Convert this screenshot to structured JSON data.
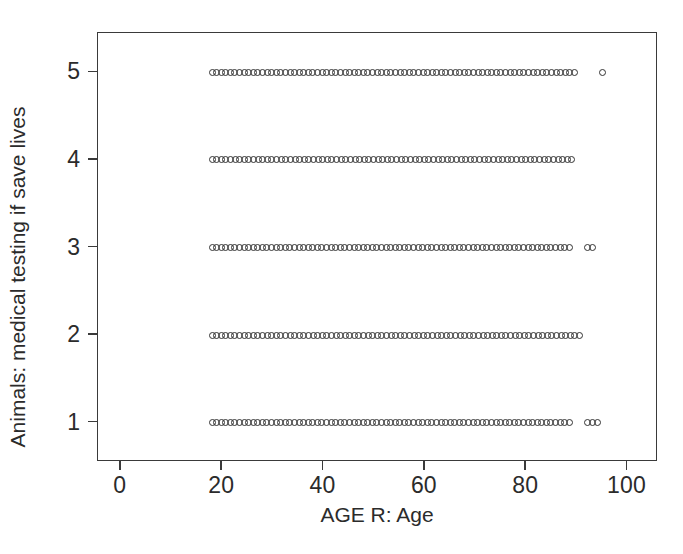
{
  "chart_data": {
    "type": "scatter",
    "title": "",
    "xlabel": "AGE R: Age",
    "ylabel": "Animals: medical testing if save lives",
    "xlim": [
      -4.5,
      106
    ],
    "ylim": [
      0.55,
      5.45
    ],
    "grid": false,
    "legend": null,
    "marker": "open-circle",
    "x_ticks": [
      0,
      20,
      40,
      60,
      80,
      100
    ],
    "x_tick_labels": [
      "0",
      "20",
      "40",
      "60",
      "80",
      "100"
    ],
    "y_ticks": [
      1,
      2,
      3,
      4,
      5
    ],
    "y_tick_labels": [
      "1",
      "2",
      "3",
      "4",
      "5"
    ],
    "series": [
      {
        "name": "Animals: medical testing if save lives",
        "points_by_level": [
          {
            "y": 5,
            "x_runs": [
              [
                18.0,
                89.5
              ]
            ],
            "x_isolated": [
              95.0
            ]
          },
          {
            "y": 4,
            "x_runs": [
              [
                18.0,
                89.0
              ]
            ],
            "x_isolated": []
          },
          {
            "y": 3,
            "x_runs": [
              [
                18.0,
                88.5
              ]
            ],
            "x_isolated": [
              92.0,
              93.0
            ]
          },
          {
            "y": 2,
            "x_runs": [
              [
                18.0,
                90.5
              ]
            ],
            "x_isolated": []
          },
          {
            "y": 1,
            "x_runs": [
              [
                18.0,
                88.5
              ]
            ],
            "x_isolated": [
              92.0,
              93.0,
              94.0
            ]
          }
        ]
      }
    ]
  },
  "axes": {
    "x_title": "AGE R: Age",
    "y_title": "Animals: medical testing if save lives",
    "x_tick_labels": [
      "0",
      "20",
      "40",
      "60",
      "80",
      "100"
    ],
    "y_tick_labels": [
      "1",
      "2",
      "3",
      "4",
      "5"
    ]
  },
  "colors": {
    "background": "#ffffff",
    "axis": "#3a3a3a",
    "text": "#2b2b2b",
    "marker_stroke": "#333333"
  }
}
